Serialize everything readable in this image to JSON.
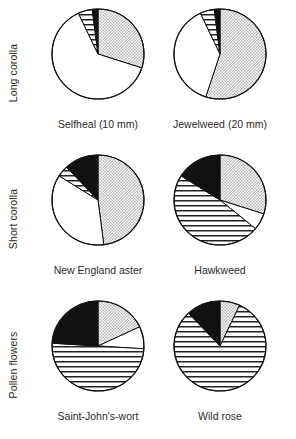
{
  "figure": {
    "colors": {
      "outline": "#111111",
      "black_wedge": "#111111",
      "stipple": "#b8b8b8",
      "stripe": "#222222",
      "white": "#ffffff"
    },
    "patterns": {
      "white_name": "white-open",
      "stripe_name": "horizontal-stripes",
      "black_name": "solid-black",
      "stipple_name": "stipple-dots"
    }
  },
  "rows": [
    {
      "label": "Long corolla"
    },
    {
      "label": "Short corolla"
    },
    {
      "label": "Pollen flowers"
    }
  ],
  "chart_data": [
    {
      "type": "pie",
      "title": "Selfheal  (10 mm)",
      "row": "Long corolla",
      "start_angle": 0,
      "categories": [
        "stipple",
        "white",
        "stripe",
        "black"
      ],
      "values": [
        30,
        63,
        5,
        2
      ],
      "slices": [
        {
          "pattern": "stipple",
          "value": 30
        },
        {
          "pattern": "white",
          "value": 63
        },
        {
          "pattern": "stripe",
          "value": 5
        },
        {
          "pattern": "black",
          "value": 2
        }
      ]
    },
    {
      "type": "pie",
      "title": "Jewelweed  (20 mm)",
      "row": "Long corolla",
      "start_angle": 0,
      "categories": [
        "stipple",
        "white",
        "stripe",
        "black"
      ],
      "values": [
        55,
        38,
        5,
        2
      ],
      "slices": [
        {
          "pattern": "stipple",
          "value": 55
        },
        {
          "pattern": "white",
          "value": 38
        },
        {
          "pattern": "stripe",
          "value": 5
        },
        {
          "pattern": "black",
          "value": 2
        }
      ]
    },
    {
      "type": "pie",
      "title": "New England aster",
      "row": "Short corolla",
      "start_angle": 0,
      "categories": [
        "stipple",
        "white",
        "stripe",
        "black"
      ],
      "values": [
        48,
        36,
        4,
        12
      ],
      "slices": [
        {
          "pattern": "stipple",
          "value": 48
        },
        {
          "pattern": "white",
          "value": 36
        },
        {
          "pattern": "stripe",
          "value": 4
        },
        {
          "pattern": "black",
          "value": 12
        }
      ]
    },
    {
      "type": "pie",
      "title": "Hawkweed",
      "row": "Short corolla",
      "start_angle": 0,
      "categories": [
        "stipple",
        "white",
        "stripe",
        "black"
      ],
      "values": [
        30,
        6,
        48,
        16
      ],
      "slices": [
        {
          "pattern": "stipple",
          "value": 30
        },
        {
          "pattern": "white",
          "value": 6
        },
        {
          "pattern": "stripe",
          "value": 48
        },
        {
          "pattern": "black",
          "value": 16
        }
      ]
    },
    {
      "type": "pie",
      "title": "Saint-John's-wort",
      "row": "Pollen flowers",
      "start_angle": 0,
      "categories": [
        "stipple",
        "white",
        "stripe",
        "black"
      ],
      "values": [
        18,
        8,
        50,
        24
      ],
      "slices": [
        {
          "pattern": "stipple",
          "value": 18
        },
        {
          "pattern": "white",
          "value": 8
        },
        {
          "pattern": "stripe",
          "value": 50
        },
        {
          "pattern": "black",
          "value": 24
        }
      ]
    },
    {
      "type": "pie",
      "title": "Wild rose",
      "row": "Pollen flowers",
      "start_angle": 0,
      "categories": [
        "stipple",
        "white",
        "stripe",
        "black"
      ],
      "values": [
        7,
        0,
        81,
        12
      ],
      "slices": [
        {
          "pattern": "stipple",
          "value": 7
        },
        {
          "pattern": "white",
          "value": 0
        },
        {
          "pattern": "stripe",
          "value": 81
        },
        {
          "pattern": "black",
          "value": 12
        }
      ]
    }
  ]
}
